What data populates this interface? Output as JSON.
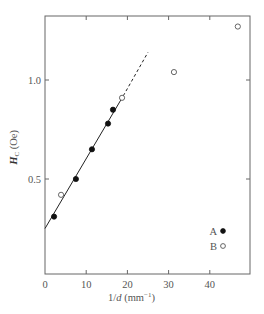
{
  "chart_data": {
    "type": "scatter",
    "title": "",
    "xlabel": "1/d (mm⁻¹)",
    "xlabel_parts": {
      "var": "1/",
      "italic": "d",
      "unit": " (mm",
      "sup": "−1",
      "close": ")"
    },
    "ylabel": "H_C (Oe)",
    "ylabel_parts": {
      "main": "H",
      "sub": "C",
      "unit": " (Oe)"
    },
    "xlim": [
      0,
      50
    ],
    "ylim": [
      0,
      1.3
    ],
    "x_ticks": [
      0,
      10,
      20,
      30,
      40
    ],
    "x_tick_labels": [
      "0",
      "10",
      "20",
      "30",
      "40"
    ],
    "y_ticks": [
      0.5,
      1.0
    ],
    "y_tick_labels": [
      "0.5",
      "1.0"
    ],
    "grid": false,
    "legend_position": "lower right",
    "series": [
      {
        "name": "A",
        "marker": "filled-circle",
        "x": [
          2.2,
          7.5,
          11.4,
          15.3,
          16.5
        ],
        "y": [
          0.31,
          0.5,
          0.65,
          0.78,
          0.85
        ]
      },
      {
        "name": "B",
        "marker": "open-circle",
        "x": [
          3.9,
          18.7,
          31.3,
          46.8
        ],
        "y": [
          0.42,
          0.91,
          1.04,
          1.27
        ]
      }
    ],
    "fit_line": {
      "solid": {
        "x": [
          0,
          19
        ],
        "y": [
          0.25,
          0.92
        ]
      },
      "dashed": {
        "x": [
          19,
          25
        ],
        "y": [
          0.92,
          1.14
        ]
      }
    }
  },
  "legend": {
    "items": [
      {
        "label": "A",
        "marker": "filled-circle"
      },
      {
        "label": "B",
        "marker": "open-circle"
      }
    ]
  }
}
